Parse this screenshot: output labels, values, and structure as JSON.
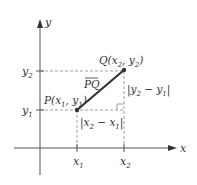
{
  "diagram": {
    "colors": {
      "axis": "#555555",
      "segment": "#333333",
      "dashed": "#888888",
      "text": "#333333"
    },
    "axes": {
      "x_label": "x",
      "y_label": "y"
    },
    "ticks": {
      "x1": "x",
      "x1_sub": "1",
      "x2": "x",
      "x2_sub": "2",
      "y1": "y",
      "y1_sub": "1",
      "y2": "y",
      "y2_sub": "2"
    },
    "points": {
      "P": {
        "name": "P",
        "label": "P(x",
        "sub1": "1",
        "mid": ", y",
        "sub2": "1",
        "end": ")"
      },
      "Q": {
        "name": "Q",
        "label": "Q(x",
        "sub1": "2",
        "mid": ", y",
        "sub2": "2",
        "end": ")"
      }
    },
    "segment_label": "PQ",
    "horizontal_distance": {
      "a": "|x",
      "a_sub": "2",
      "b": " − x",
      "b_sub": "1",
      "end": "|"
    },
    "vertical_distance": {
      "a": "|y",
      "a_sub": "2",
      "b": " − y",
      "b_sub": "1",
      "end": "|"
    }
  }
}
